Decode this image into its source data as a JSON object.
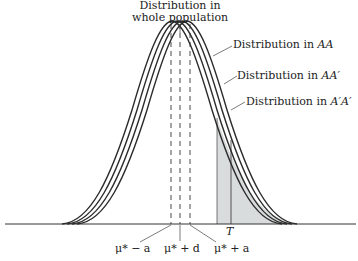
{
  "title": {
    "line1": "Distribution in",
    "line2": "whole population"
  },
  "curve_labels": {
    "AA": {
      "prefix": "Distribution in ",
      "genotype": "AA"
    },
    "AAp": {
      "prefix": "Distribution in ",
      "genotype": "AA′"
    },
    "ApAp": {
      "prefix": "Distribution in ",
      "genotype": "A′A′"
    }
  },
  "axis_labels": {
    "mu_minus_a": "μ* − a",
    "mu_plus_d": "μ* + d",
    "mu_plus_a": "μ* + a",
    "threshold": "T"
  },
  "colors": {
    "curve": "#2b2b2b",
    "shade": "#d9dcdc",
    "axis": "#333333"
  }
}
